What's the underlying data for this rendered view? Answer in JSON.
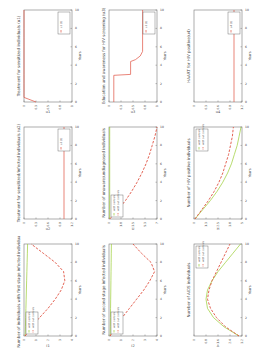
{
  "chart_data": [
    {
      "type": "line",
      "title": "Treatment for sensitized individuals (u1)",
      "xlabel": "Years",
      "ylabel": "u1",
      "x": [
        0,
        0.5,
        1,
        2,
        3,
        4,
        5,
        6,
        7,
        8,
        9,
        10
      ],
      "series": [
        {
          "name": "u1 (t)",
          "style": "solid",
          "color": "#e05040",
          "values": [
            0.25,
            0.0,
            0,
            0,
            0,
            0,
            0,
            0,
            0,
            0,
            0,
            0
          ]
        }
      ],
      "xlim": [
        0,
        10
      ],
      "ylim": [
        0,
        1
      ],
      "legend": "top-right"
    },
    {
      "type": "line",
      "title": "Treatment for sensitized/infected individuals (u2)",
      "xlabel": "Years",
      "ylabel": "u2",
      "x": [
        0,
        0.1,
        10
      ],
      "series": [
        {
          "name": "u2 (t)",
          "style": "solid",
          "color": "#e05040",
          "values": [
            1,
            1,
            1
          ]
        }
      ],
      "xlim": [
        0,
        10
      ],
      "ylim": [
        0,
        1.2
      ],
      "legend": "top-right"
    },
    {
      "type": "line",
      "title": "Number of individuals with first stage infected individuals",
      "xlabel": "Years",
      "ylabel": "I1",
      "x": [
        0,
        1,
        2,
        3,
        4,
        5,
        6,
        7,
        8,
        9,
        10
      ],
      "series": [
        {
          "name": "with controls",
          "style": "solid",
          "color": "#9acd32",
          "values": [
            0.1,
            0.12,
            0.14,
            0.16,
            0.18,
            0.2,
            0.22,
            0.24,
            0.26,
            0.28,
            0.3
          ]
        },
        {
          "name": "with out controls",
          "style": "dashed",
          "color": "#e05040",
          "values": [
            0.1,
            0.6,
            1.3,
            2.0,
            2.6,
            3.1,
            3.4,
            3.3,
            2.6,
            1.6,
            0.6
          ]
        }
      ],
      "xlim": [
        0,
        10
      ],
      "ylim": [
        0,
        4
      ],
      "legend": "bottom-left"
    },
    {
      "type": "line",
      "title": "Education and awareness for HIV screening (u3)",
      "xlabel": "Years",
      "ylabel": "u3",
      "x": [
        0,
        2.9,
        3.0,
        4.4,
        4.6,
        5.0,
        5.5,
        10
      ],
      "series": [
        {
          "name": "u3 (t)",
          "style": "solid",
          "color": "#e05040",
          "values": [
            0.1,
            0.1,
            0.45,
            0.45,
            0.55,
            0.65,
            0.7,
            0.7
          ]
        }
      ],
      "xlim": [
        0,
        10
      ],
      "ylim": [
        0,
        1
      ],
      "legend": "top-right"
    },
    {
      "type": "line",
      "title": "Number of unaware/undiagnosed individuals",
      "xlabel": "Years",
      "ylabel": "U",
      "x": [
        0,
        1,
        2,
        3,
        4,
        5,
        6,
        7,
        8,
        9,
        10
      ],
      "series": [
        {
          "name": "with controls",
          "style": "solid",
          "color": "#9acd32",
          "values": [
            0.1,
            0.1,
            0.1,
            0.1,
            0.1,
            0.1,
            0.1,
            0.1,
            0.1,
            0.1,
            0.1
          ]
        },
        {
          "name": "with out controls",
          "style": "dashed",
          "color": "#e05040",
          "values": [
            0.1,
            1.3,
            2.4,
            3.3,
            4.1,
            4.8,
            5.4,
            5.9,
            6.3,
            6.7,
            7.0
          ]
        }
      ],
      "xlim": [
        0,
        10
      ],
      "ylim": [
        0,
        7
      ],
      "legend": "bottom-left"
    },
    {
      "type": "line",
      "title": "Number of second stage infected individuals",
      "xlabel": "Years",
      "ylabel": "I2",
      "x": [
        0,
        1,
        2,
        3,
        4,
        5,
        6,
        7,
        8,
        9,
        10
      ],
      "series": [
        {
          "name": "with controls",
          "style": "solid",
          "color": "#9acd32",
          "values": [
            0.1,
            0.11,
            0.12,
            0.13,
            0.14,
            0.15,
            0.16,
            0.17,
            0.18,
            0.19,
            0.2
          ]
        },
        {
          "name": "with out controls",
          "style": "dashed",
          "color": "#e05040",
          "values": [
            0.1,
            0.5,
            1.1,
            1.7,
            2.3,
            2.9,
            3.4,
            3.8,
            3.5,
            2.7,
            2.0
          ]
        }
      ],
      "xlim": [
        0,
        10
      ],
      "ylim": [
        0,
        4
      ],
      "legend": "bottom-left"
    },
    {
      "type": "line",
      "title": "HAART for HIV positive(u4)",
      "xlabel": "Years",
      "ylabel": "u4",
      "x": [
        0,
        0.1,
        10
      ],
      "series": [
        {
          "name": "u4 (t)",
          "style": "solid",
          "color": "#e05040",
          "values": [
            1,
            1,
            1
          ]
        }
      ],
      "xlim": [
        0,
        10
      ],
      "ylim": [
        0,
        1.2
      ],
      "legend": "top-right"
    },
    {
      "type": "line",
      "title": "Number of HIV positive individuals",
      "xlabel": "Years",
      "ylabel": "H",
      "x": [
        0,
        1,
        2,
        3,
        4,
        5,
        6,
        7,
        8,
        9,
        10
      ],
      "series": [
        {
          "name": "with controls",
          "style": "solid",
          "color": "#9acd32",
          "values": [
            0.1,
            0.9,
            1.7,
            2.4,
            3.0,
            3.5,
            3.9,
            4.2,
            4.5,
            4.7,
            4.9
          ]
        },
        {
          "name": "with out controls",
          "style": "dashed",
          "color": "#e05040",
          "values": [
            0.1,
            0.8,
            1.5,
            2.1,
            2.6,
            3.0,
            3.3,
            3.6,
            3.8,
            4.0,
            4.1
          ]
        }
      ],
      "xlim": [
        0,
        10
      ],
      "ylim": [
        0,
        5
      ],
      "legend": "top-left"
    },
    {
      "type": "line",
      "title": "Number of AIDS individuals",
      "xlabel": "Years",
      "ylabel": "A",
      "x": [
        0,
        1,
        2,
        3,
        4,
        5,
        6,
        7,
        8,
        9,
        10
      ],
      "series": [
        {
          "name": "with controls",
          "style": "solid",
          "color": "#9acd32",
          "values": [
            3.0,
            2.0,
            1.3,
            0.9,
            0.8,
            0.9,
            1.2,
            1.6,
            2.1,
            2.6,
            3.1
          ]
        },
        {
          "name": "with out controls",
          "style": "dashed",
          "color": "#e05040",
          "values": [
            3.0,
            2.1,
            1.5,
            1.1,
            0.9,
            1.0,
            1.2,
            1.5,
            1.8,
            2.1,
            2.4
          ]
        }
      ],
      "xlim": [
        0,
        10
      ],
      "ylim": [
        0,
        3.2
      ],
      "legend": "top-left"
    }
  ]
}
